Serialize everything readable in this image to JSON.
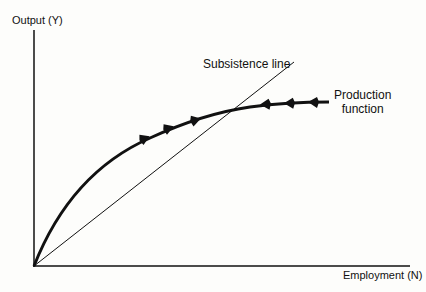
{
  "figure": {
    "y_axis_label": "Output (Y)",
    "x_axis_label": "Employment (N)",
    "curves": [
      {
        "name": "Subsistence line",
        "style": "thin straight line from origin"
      },
      {
        "name": "Production function",
        "style": "thick concave curve with arrows converging to intersection"
      }
    ],
    "labels": {
      "subsistence": "Subsistence line",
      "production_line1": "Production",
      "production_line2": "function"
    },
    "arrows": {
      "left_of_intersection": "pointing right (toward equilibrium)",
      "right_of_intersection": "pointing left (toward equilibrium)"
    },
    "colors": {
      "ink": "#111111",
      "background": "#fdfdfb"
    }
  }
}
